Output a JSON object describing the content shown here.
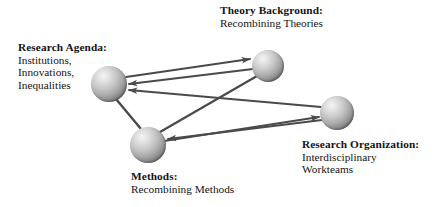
{
  "diagram": {
    "background_color": "#ffffff",
    "edge_color": "#4a4a4a",
    "node_fill_light": "#f0f0f0",
    "node_fill_dark": "#303030",
    "nodes": [
      {
        "id": "research-agenda",
        "heading": "Research Agenda:",
        "lines": [
          "Institutions,",
          "Innovations,",
          "Inequalities"
        ],
        "cx": 109,
        "cy": 84,
        "r": 18
      },
      {
        "id": "theory-background",
        "heading": "Theory Background:",
        "lines": [
          "Recombining Theories"
        ],
        "cx": 268,
        "cy": 66,
        "r": 16
      },
      {
        "id": "methods",
        "heading": "Methods:",
        "lines": [
          "Recombining Methods"
        ],
        "cx": 148,
        "cy": 145,
        "r": 18
      },
      {
        "id": "research-organization",
        "heading": "Research Organization:",
        "lines": [
          "Interdisciplinary",
          "Workteams"
        ],
        "cx": 337,
        "cy": 113,
        "r": 17
      }
    ],
    "edges": [
      {
        "id": "agenda-to-theory",
        "from": "research-agenda",
        "to": "theory-background",
        "arrow": "to"
      },
      {
        "id": "theory-to-agenda",
        "from": "theory-background",
        "to": "research-agenda",
        "arrow": "to"
      },
      {
        "id": "organization-to-agenda",
        "from": "research-organization",
        "to": "research-agenda",
        "arrow": "to"
      },
      {
        "id": "organization-to-methods",
        "from": "research-organization",
        "to": "methods",
        "arrow": "to"
      },
      {
        "id": "methods-to-organization",
        "from": "methods",
        "to": "research-organization",
        "arrow": "to"
      },
      {
        "id": "methods-to-theory",
        "from": "methods",
        "to": "theory-background",
        "arrow": "none"
      },
      {
        "id": "agenda-to-methods",
        "from": "research-agenda",
        "to": "methods",
        "arrow": "none"
      }
    ]
  }
}
